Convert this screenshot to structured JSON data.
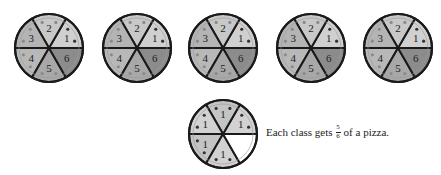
{
  "pizzas_top": [
    {
      "cx": 49,
      "cy": 48,
      "slices": [
        "1",
        "2",
        "3",
        "4",
        "5",
        "6"
      ]
    },
    {
      "cx": 137,
      "cy": 48,
      "slices": [
        "1",
        "2",
        "3",
        "4",
        "5",
        "6"
      ]
    },
    {
      "cx": 223,
      "cy": 48,
      "slices": [
        "1",
        "2",
        "3",
        "4",
        "5",
        "6"
      ]
    },
    {
      "cx": 311,
      "cy": 48,
      "slices": [
        "1",
        "2",
        "3",
        "4",
        "5",
        "6"
      ]
    },
    {
      "cx": 398,
      "cy": 48,
      "slices": [
        "1",
        "2",
        "3",
        "4",
        "5",
        "6"
      ]
    }
  ],
  "pizza_bottom": {
    "cx": 223,
    "cy": 134,
    "slices": [
      "1",
      "1",
      "1",
      "1",
      "1",
      ""
    ]
  },
  "caption": {
    "prefix": "Each class gets",
    "numerator": "5",
    "denominator": "6",
    "suffix": "of a pizza."
  },
  "colors": {
    "slice1": "#d0d0d0",
    "slice2": "#c8c8c8",
    "slice3": "#b4b4b4",
    "slice4": "#b8b8b8",
    "slice5": "#a8a8a8",
    "slice6": "#8c8c8c",
    "empty": "#ffffff",
    "outline": "#1a1a1a"
  }
}
